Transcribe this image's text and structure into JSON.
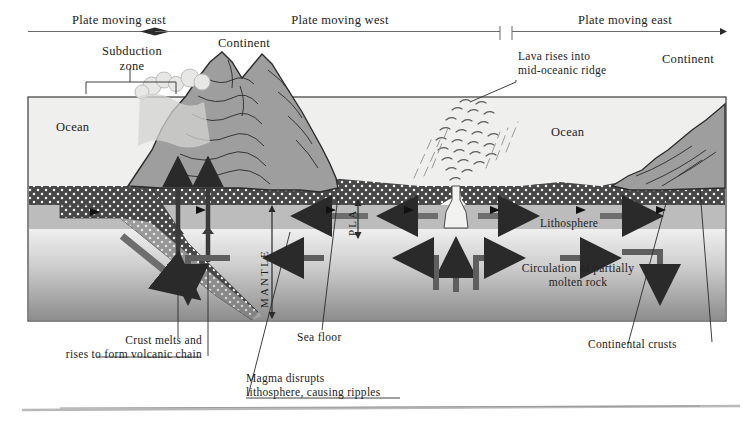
{
  "figure": {
    "type": "cross-section-diagram"
  },
  "top_scale": {
    "spans": [
      {
        "label": "Plate moving east",
        "direction": "east"
      },
      {
        "label": "Plate moving west",
        "direction": "west"
      },
      {
        "label": "Plate moving east",
        "direction": "east"
      }
    ]
  },
  "labels": {
    "subduction_zone": "Subduction\nzone",
    "continent_left": "Continent",
    "continent_right": "Continent",
    "ocean_left": "Ocean",
    "ocean_right": "Ocean",
    "lava_ridge": "Lava rises into\nmid-oceanic ridge",
    "lithosphere": "Lithosphere",
    "mantle": "MANTLE",
    "plate": "PLA",
    "circulation": "Circulation of partially\nmolten rock",
    "crust_melts": "Crust melts and\nrises to form volcanic chain",
    "sea_floor": "Sea floor",
    "magma_disrupts": "Magma disrupts\nlithosphere, causing ripples",
    "continental_crusts": "Continental crusts"
  },
  "colors": {
    "ink": "#222222",
    "ocean_fill": "#eeeeec",
    "lithosphere_dark": "#4a4a4a",
    "asthenosphere": "#b9b9b9",
    "mantle_light": "#d8d8d8",
    "mantle_deep": "#8e8e8e",
    "crust_gray": "#9c9c9c",
    "arrow_gray": "#5b5b5b",
    "frame": "#333333"
  }
}
